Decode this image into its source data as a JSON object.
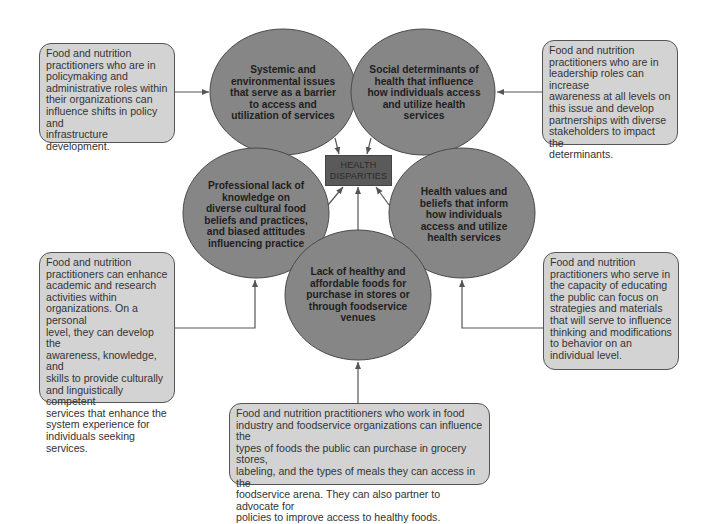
{
  "colors": {
    "circle_fill": "#868686",
    "circle_stroke": "#4a4a4a",
    "note_fill": "#d3d3d3",
    "note_stroke": "#555555",
    "center_box_fill": "#5a5a5a",
    "line": "#555555"
  },
  "center": {
    "line1": "HEALTH",
    "line2": "DISPARITIES"
  },
  "circles": [
    {
      "id": "systemic",
      "lines": [
        "Systemic and",
        "environmental issues",
        "that serve as a barrier",
        "to access and",
        "utilization of services"
      ]
    },
    {
      "id": "social-determinants",
      "lines": [
        "Social determinants of",
        "health that influence",
        "how individuals access",
        "and utilize health",
        "services"
      ]
    },
    {
      "id": "professional-knowledge",
      "lines": [
        "Professional lack of",
        "knowledge on",
        "diverse cultural food",
        "beliefs and practices,",
        "and biased attitudes",
        "influencing practice"
      ]
    },
    {
      "id": "health-values",
      "lines": [
        "Health values and",
        "beliefs that inform",
        "how individuals",
        "access and utilize",
        "health services"
      ]
    },
    {
      "id": "healthy-foods",
      "lines": [
        "Lack of healthy and",
        "affordable foods for",
        "purchase in stores or",
        "through foodservice",
        "venues"
      ]
    }
  ],
  "notes": [
    {
      "id": "policymaking",
      "lines": [
        "Food and nutrition",
        "practitioners who are in",
        "policymaking and",
        "administrative roles within",
        "their organizations can",
        "influence shifts in policy and",
        "infrastructure development."
      ]
    },
    {
      "id": "leadership",
      "lines": [
        "Food and nutrition",
        "practitioners who are in",
        "leadership roles can increase",
        "awareness at all levels on",
        "this issue and develop",
        "partnerships with diverse",
        "stakeholders to impact the",
        "determinants."
      ]
    },
    {
      "id": "academic",
      "lines": [
        "Food and nutrition",
        "practitioners can enhance",
        "academic and research",
        "activities within",
        "organizations. On a personal",
        "level, they can develop the",
        "awareness, knowledge, and",
        "skills to provide culturally",
        "and linguistically competent",
        "services that enhance the",
        "system experience for",
        "individuals seeking services."
      ]
    },
    {
      "id": "educating",
      "lines": [
        "Food and nutrition",
        "practitioners who serve in",
        "the capacity of educating",
        "the public can focus on",
        "strategies and materials",
        "that will serve to influence",
        "thinking and modifications",
        "to behavior on an",
        "individual level."
      ]
    },
    {
      "id": "food-industry",
      "lines": [
        "Food and nutrition practitioners who work in food",
        "industry and foodservice organizations can influence the",
        "types of foods the public can purchase in grocery stores,",
        "labeling, and the types of meals they can access in the",
        "foodservice arena. They can also partner to advocate for",
        "policies to improve access to healthy foods."
      ]
    }
  ]
}
